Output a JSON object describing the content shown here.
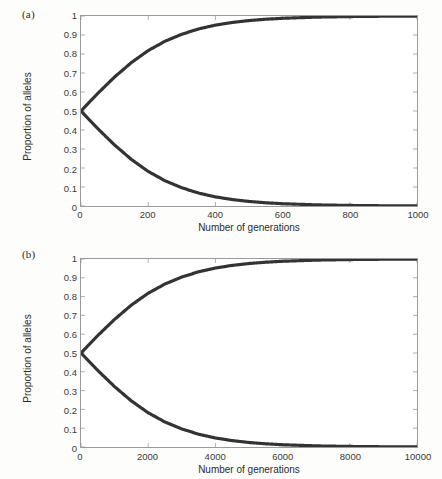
{
  "figure": {
    "background_color": "#fdfdfc",
    "curve_color": "#333333",
    "axis_color": "#9a9a9a",
    "text_color": "#2b2b2b"
  },
  "panels": [
    {
      "id": "a",
      "label": "(a)",
      "chart_data": {
        "type": "line",
        "title": "",
        "xlabel": "Number of generations",
        "ylabel": "Proportion of alleles",
        "xlim": [
          0,
          1000
        ],
        "ylim": [
          0,
          1
        ],
        "xticks": [
          0,
          200,
          400,
          600,
          800,
          1000
        ],
        "xtick_labels": [
          "0",
          "200",
          "400",
          "600",
          "800",
          "1000"
        ],
        "yticks": [
          0,
          0.1,
          0.2,
          0.3,
          0.4,
          0.5,
          0.6,
          0.7,
          0.8,
          0.9,
          1
        ],
        "ytick_labels": [
          "0",
          "0.1",
          "0.2",
          "0.3",
          "0.4",
          "0.5",
          "0.6",
          "0.7",
          "0.8",
          "0.9",
          "1"
        ],
        "grid": false,
        "legend": null,
        "series": [
          {
            "name": "Favoured allele",
            "color": "#333333",
            "x": [
              0,
              50,
              100,
              150,
              200,
              250,
              300,
              350,
              400,
              450,
              500,
              550,
              600,
              700,
              800,
              900,
              1000
            ],
            "values": [
              0.5,
              0.593,
              0.679,
              0.755,
              0.818,
              0.867,
              0.904,
              0.932,
              0.952,
              0.966,
              0.976,
              0.983,
              0.988,
              0.994,
              0.997,
              0.9987,
              0.9994
            ]
          },
          {
            "name": "Disfavoured allele",
            "color": "#333333",
            "x": [
              0,
              50,
              100,
              150,
              200,
              250,
              300,
              350,
              400,
              450,
              500,
              550,
              600,
              700,
              800,
              900,
              1000
            ],
            "values": [
              0.5,
              0.407,
              0.321,
              0.245,
              0.182,
              0.133,
              0.096,
              0.068,
              0.048,
              0.034,
              0.024,
              0.017,
              0.012,
              0.006,
              0.003,
              0.0013,
              0.0006
            ]
          }
        ]
      }
    },
    {
      "id": "b",
      "label": "(b)",
      "chart_data": {
        "type": "line",
        "title": "",
        "xlabel": "Number of generations",
        "ylabel": "Proportion of alleles",
        "xlim": [
          0,
          10000
        ],
        "ylim": [
          0,
          1
        ],
        "xticks": [
          0,
          2000,
          4000,
          6000,
          8000,
          10000
        ],
        "xtick_labels": [
          "0",
          "2000",
          "4000",
          "6000",
          "8000",
          "10000"
        ],
        "yticks": [
          0,
          0.1,
          0.2,
          0.3,
          0.4,
          0.5,
          0.6,
          0.7,
          0.8,
          0.9,
          1
        ],
        "ytick_labels": [
          "0",
          "0.1",
          "0.2",
          "0.3",
          "0.4",
          "0.5",
          "0.6",
          "0.7",
          "0.8",
          "0.9",
          "1"
        ],
        "grid": false,
        "legend": null,
        "series": [
          {
            "name": "Favoured allele",
            "color": "#333333",
            "x": [
              0,
              500,
              1000,
              1500,
              2000,
              2500,
              3000,
              3500,
              4000,
              4500,
              5000,
              5500,
              6000,
              7000,
              8000,
              9000,
              10000
            ],
            "values": [
              0.5,
              0.593,
              0.679,
              0.755,
              0.818,
              0.867,
              0.904,
              0.932,
              0.952,
              0.966,
              0.976,
              0.983,
              0.988,
              0.994,
              0.997,
              0.9987,
              0.9994
            ]
          },
          {
            "name": "Disfavoured allele",
            "color": "#333333",
            "x": [
              0,
              500,
              1000,
              1500,
              2000,
              2500,
              3000,
              3500,
              4000,
              4500,
              5000,
              5500,
              6000,
              7000,
              8000,
              9000,
              10000
            ],
            "values": [
              0.5,
              0.407,
              0.321,
              0.245,
              0.182,
              0.133,
              0.096,
              0.068,
              0.048,
              0.034,
              0.024,
              0.017,
              0.012,
              0.006,
              0.003,
              0.0013,
              0.0006
            ]
          }
        ]
      }
    }
  ]
}
